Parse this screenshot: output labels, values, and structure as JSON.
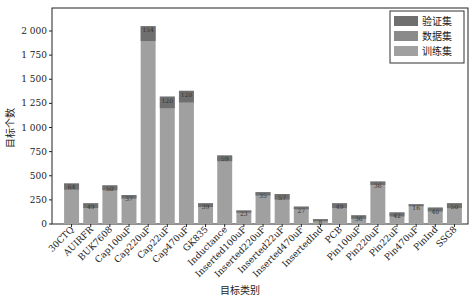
{
  "chart_data": {
    "type": "bar",
    "stacked": true,
    "title": "",
    "xlabel": "目标类别",
    "ylabel": "目标个数",
    "ylim": [
      0,
      2150
    ],
    "yticks": [
      0,
      250,
      500,
      750,
      1000,
      1250,
      1500,
      1750,
      2000
    ],
    "ytick_labels": [
      "0",
      "250",
      "500",
      "750",
      "1 000",
      "1 250",
      "1 500",
      "1 750",
      "2 000"
    ],
    "grid": false,
    "legend_position": "upper right",
    "categories": [
      "30CTQ",
      "AUIRFR",
      "BUK7608",
      "Cap100uF",
      "Cap220uF",
      "Cap22uF",
      "Cap470uF",
      "GK835",
      "Inductance",
      "Inserted100uF",
      "Inserted220uF",
      "Inserted22uF",
      "Inserted470uF",
      "InsertedInd",
      "PCB",
      "Pin100uF",
      "Pin220uF",
      "Pin22uF",
      "Pin470uF",
      "PinInd",
      "SSG8"
    ],
    "totals": [
      420,
      215,
      400,
      300,
      2050,
      1320,
      1380,
      215,
      710,
      140,
      330,
      310,
      180,
      50,
      215,
      90,
      440,
      120,
      205,
      170,
      215
    ],
    "top_labels": [
      "64",
      "49",
      "50",
      "37",
      "154",
      "120",
      "120",
      "39",
      "59",
      "23",
      "35",
      "57",
      "27",
      "8",
      "49",
      "36",
      "36",
      "42",
      "16",
      "40",
      "50"
    ],
    "series": [
      {
        "name": "验证集",
        "color": "#6f6f6f",
        "values": [
          64,
          49,
          50,
          37,
          154,
          120,
          120,
          39,
          59,
          23,
          35,
          57,
          27,
          8,
          49,
          36,
          36,
          42,
          16,
          40,
          50
        ]
      },
      {
        "name": "数据集",
        "color": "#8a8a8a",
        "values": [
          0,
          0,
          0,
          0,
          0,
          0,
          0,
          0,
          0,
          0,
          0,
          0,
          0,
          0,
          0,
          0,
          0,
          0,
          0,
          0,
          0
        ]
      },
      {
        "name": "训练集",
        "color": "#a0a0a0",
        "values": [
          356,
          166,
          350,
          263,
          1896,
          1200,
          1260,
          176,
          651,
          117,
          295,
          253,
          153,
          42,
          166,
          54,
          404,
          78,
          189,
          130,
          165
        ]
      }
    ]
  },
  "legend": {
    "items": [
      "验证集",
      "数据集",
      "训练集"
    ]
  }
}
